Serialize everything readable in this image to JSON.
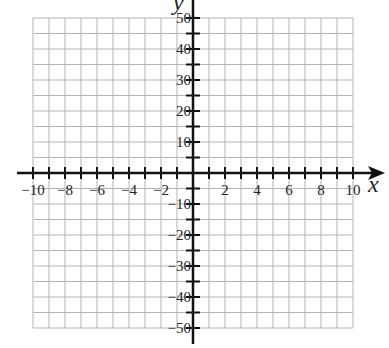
{
  "chart_data": {
    "type": "scatter",
    "title": "",
    "xlabel": "x",
    "ylabel": "y",
    "xlim": [
      -10,
      10
    ],
    "ylim": [
      -50,
      50
    ],
    "grid": true,
    "x_grid_step": 1,
    "y_grid_step": 5,
    "x_tick_step": 1,
    "y_tick_step": 5,
    "x_tick_labels": [
      "-10",
      "-8",
      "-6",
      "-4",
      "-2",
      "2",
      "4",
      "6",
      "8",
      "10"
    ],
    "y_tick_labels": [
      "50",
      "40",
      "30",
      "20",
      "10",
      "-10",
      "-20",
      "-30",
      "-40",
      "-50"
    ],
    "series": [],
    "legend": null
  },
  "colors": {
    "grid": "#b5b5b5",
    "axis": "#111111",
    "text": "#222222"
  }
}
